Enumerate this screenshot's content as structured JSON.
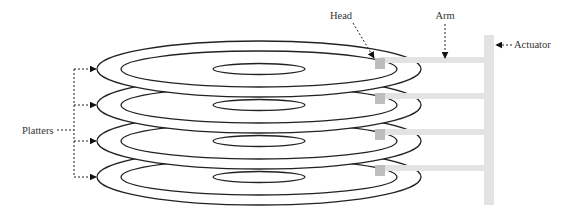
{
  "diagram": {
    "labels": {
      "head": "Head",
      "arm": "Arm",
      "actuator": "Actuator",
      "platters": "Platters"
    },
    "platter_count": 4,
    "colors": {
      "line": "#222222",
      "arm": "#e3e3e3",
      "head": "#bdbdbd",
      "background": "#ffffff"
    }
  }
}
